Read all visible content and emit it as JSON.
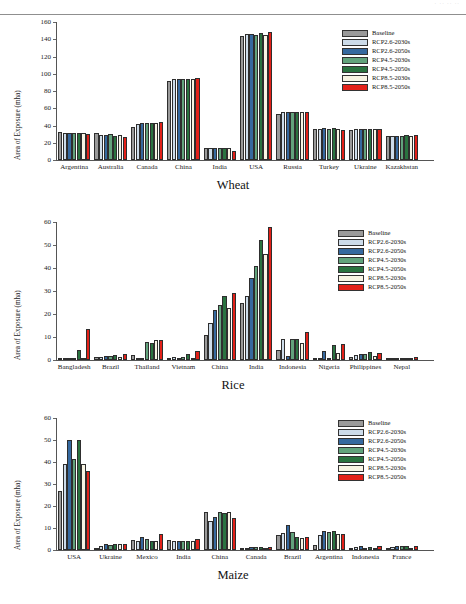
{
  "header": {
    "ghost_text": "· ·· ·· ··"
  },
  "legend": {
    "position": "top-right",
    "entries": [
      {
        "label": "Baseline",
        "color": "#9a9a9a"
      },
      {
        "label": "RCP2.6-2030s",
        "color": "#cddcea"
      },
      {
        "label": "RCP2.6-2050s",
        "color": "#36699f"
      },
      {
        "label": "RCP4.5-2030s",
        "color": "#62a37c"
      },
      {
        "label": "RCP4.5-2050s",
        "color": "#2a7340"
      },
      {
        "label": "RCP8.5-2030s",
        "color": "#f8f4e4"
      },
      {
        "label": "RCP8.5-2050s",
        "color": "#e32119"
      }
    ]
  },
  "panels": [
    {
      "title": "Wheat",
      "ylabel": "Area of Exposure (mha)"
    },
    {
      "title": "Rice",
      "ylabel": "Area of Exposure (mha)"
    },
    {
      "title": "Maize",
      "ylabel": "Area of Exposure (mha)"
    }
  ],
  "chart_data": [
    {
      "type": "bar",
      "title": "Wheat",
      "xlabel": "",
      "ylabel": "Area of Exposure (mha)",
      "ylim": [
        0,
        160
      ],
      "yticks": [
        0,
        20,
        40,
        60,
        80,
        100,
        120,
        140,
        160
      ],
      "grid": false,
      "legend_position": "top-right",
      "categories": [
        "Argentina",
        "Australia",
        "Canada",
        "China",
        "India",
        "USA",
        "Russia",
        "Turkey",
        "Ukraine",
        "Kazakhstan"
      ],
      "series": [
        {
          "name": "Baseline",
          "color": "#9a9a9a",
          "values": [
            32.5,
            31.2,
            38.0,
            92.0,
            14.5,
            143.5,
            53.8,
            36.0,
            34.8,
            27.5
          ]
        },
        {
          "name": "RCP2.6-2030s",
          "color": "#cddcea",
          "values": [
            31.0,
            29.5,
            42.0,
            94.5,
            13.6,
            145.8,
            56.2,
            36.4,
            35.4,
            28.3
          ]
        },
        {
          "name": "RCP2.6-2050s",
          "color": "#36699f",
          "values": [
            31.4,
            28.8,
            42.4,
            94.4,
            13.8,
            146.0,
            56.0,
            36.6,
            35.6,
            28.4
          ]
        },
        {
          "name": "RCP4.5-2030s",
          "color": "#62a37c",
          "values": [
            31.0,
            29.8,
            42.6,
            94.3,
            14.0,
            145.5,
            55.8,
            36.5,
            35.5,
            28.4
          ]
        },
        {
          "name": "RCP4.5-2050s",
          "color": "#2a7340",
          "values": [
            31.2,
            28.2,
            43.2,
            94.5,
            13.4,
            147.2,
            55.9,
            36.8,
            35.6,
            28.5
          ]
        },
        {
          "name": "RCP8.5-2030s",
          "color": "#f8f4e4",
          "values": [
            31.0,
            29.0,
            42.6,
            94.4,
            14.4,
            145.4,
            56.0,
            36.3,
            35.6,
            28.3
          ]
        },
        {
          "name": "RCP8.5-2050s",
          "color": "#e32119",
          "values": [
            30.6,
            26.4,
            44.0,
            94.7,
            10.8,
            148.0,
            55.6,
            34.8,
            36.2,
            29.0
          ]
        }
      ]
    },
    {
      "type": "bar",
      "title": "Rice",
      "xlabel": "",
      "ylabel": "Area of Exposure (mha)",
      "ylim": [
        0,
        60
      ],
      "yticks": [
        0,
        10,
        20,
        30,
        40,
        50,
        60
      ],
      "grid": false,
      "legend_position": "top-right",
      "categories": [
        "Bangladesh",
        "Brazil",
        "Thailand",
        "Vietnam",
        "China",
        "India",
        "Indonesia",
        "Nigeria",
        "Philippines",
        "Nepal"
      ],
      "series": [
        {
          "name": "Baseline",
          "color": "#9a9a9a",
          "values": [
            0.15,
            1.3,
            2.1,
            0.4,
            10.8,
            24.8,
            4.3,
            0.8,
            1.1,
            0.3
          ]
        },
        {
          "name": "RCP2.6-2030s",
          "color": "#cddcea",
          "values": [
            0.9,
            1.5,
            0.9,
            1.4,
            16.0,
            28.0,
            9.1,
            0.9,
            2.2,
            0.3
          ]
        },
        {
          "name": "RCP2.6-2050s",
          "color": "#36699f",
          "values": [
            0.5,
            1.6,
            1.0,
            0.8,
            21.8,
            35.8,
            1.8,
            3.9,
            2.7,
            0.4
          ]
        },
        {
          "name": "RCP4.5-2030s",
          "color": "#62a37c",
          "values": [
            1.0,
            1.9,
            8.0,
            1.4,
            24.0,
            40.8,
            9.0,
            1.0,
            2.5,
            0.7
          ]
        },
        {
          "name": "RCP4.5-2050s",
          "color": "#2a7340",
          "values": [
            4.5,
            2.0,
            7.3,
            2.6,
            28.0,
            52.3,
            9.1,
            6.7,
            3.5,
            1.0
          ]
        },
        {
          "name": "RCP8.5-2030s",
          "color": "#f8f4e4",
          "values": [
            0.4,
            1.5,
            8.5,
            0.9,
            22.7,
            46.1,
            7.3,
            2.9,
            1.9,
            0.5
          ]
        },
        {
          "name": "RCP8.5-2050s",
          "color": "#e32119",
          "values": [
            13.5,
            2.4,
            8.8,
            3.9,
            29.2,
            57.9,
            12.2,
            6.8,
            3.2,
            1.3
          ]
        }
      ]
    },
    {
      "type": "bar",
      "title": "Maize",
      "xlabel": "",
      "ylabel": "Area of Exposure (mha)",
      "ylim": [
        0,
        60
      ],
      "yticks": [
        0,
        10,
        20,
        30,
        40,
        50,
        60
      ],
      "grid": false,
      "legend_position": "top-right",
      "categories": [
        "USA",
        "Ukraine",
        "Mexico",
        "India",
        "China",
        "Canada",
        "Brazil",
        "Argentina",
        "Indonesia",
        "France"
      ],
      "series": [
        {
          "name": "Baseline",
          "color": "#9a9a9a",
          "values": [
            27.0,
            0.8,
            4.4,
            4.7,
            17.2,
            0.4,
            7.0,
            2.5,
            1.1,
            1.0
          ]
        },
        {
          "name": "RCP2.6-2030s",
          "color": "#cddcea",
          "values": [
            39.0,
            1.6,
            4.3,
            4.0,
            13.2,
            0.5,
            7.6,
            6.7,
            1.2,
            1.2
          ]
        },
        {
          "name": "RCP2.6-2050s",
          "color": "#36699f",
          "values": [
            50.1,
            2.7,
            6.0,
            4.1,
            14.8,
            1.3,
            11.4,
            8.6,
            1.9,
            1.8
          ]
        },
        {
          "name": "RCP4.5-2030s",
          "color": "#62a37c",
          "values": [
            41.2,
            2.3,
            5.0,
            4.2,
            17.2,
            1.2,
            8.2,
            8.1,
            1.1,
            1.6
          ]
        },
        {
          "name": "RCP4.5-2050s",
          "color": "#2a7340",
          "values": [
            50.1,
            2.8,
            4.2,
            4.2,
            16.6,
            1.2,
            5.7,
            8.5,
            1.3,
            1.7
          ]
        },
        {
          "name": "RCP8.5-2030s",
          "color": "#f8f4e4",
          "values": [
            39.2,
            2.9,
            4.1,
            4.3,
            17.2,
            0.5,
            5.6,
            7.2,
            0.6,
            0.9
          ]
        },
        {
          "name": "RCP8.5-2050s",
          "color": "#e32119",
          "values": [
            36.0,
            2.9,
            7.2,
            5.0,
            14.5,
            1.5,
            6.1,
            7.2,
            1.8,
            1.9
          ]
        }
      ]
    }
  ]
}
